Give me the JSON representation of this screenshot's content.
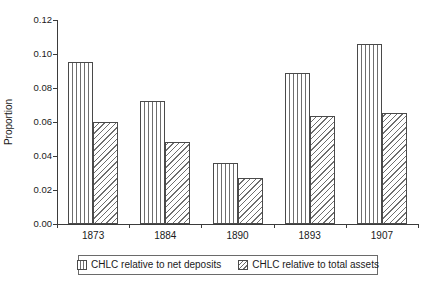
{
  "chart_data": {
    "type": "bar",
    "title": "",
    "subtitle": "",
    "xlabel": "",
    "ylabel": "Proportion",
    "categories": [
      "1873",
      "1884",
      "1890",
      "1893",
      "1907"
    ],
    "series": [
      {
        "name": "CHLC relative to net deposits",
        "pattern": "vertical-stripes",
        "values": [
          0.0955,
          0.0725,
          0.036,
          0.089,
          0.1057
        ]
      },
      {
        "name": "CHLC relative to total assets",
        "pattern": "diagonal-hatch",
        "values": [
          0.0598,
          0.048,
          0.0272,
          0.0635,
          0.0653
        ]
      }
    ],
    "ylim": [
      0.0,
      0.12
    ],
    "yticks": [
      0.0,
      0.02,
      0.04,
      0.06,
      0.08,
      0.1,
      0.12
    ],
    "ytick_labels": [
      "0.00",
      "0.02",
      "0.04",
      "0.06",
      "0.08",
      "0.10",
      "0.12"
    ],
    "grid": false,
    "legend_position": "bottom",
    "colors": {
      "axis": "#3b3b3b",
      "bar_border": "#4a4a4a",
      "pattern": "#6e6e6e",
      "background": "#ffffff",
      "text": "#1a1a1a"
    }
  }
}
